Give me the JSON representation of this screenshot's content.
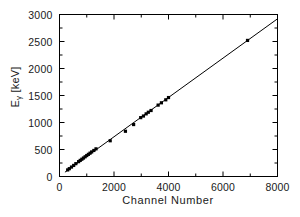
{
  "chart_data": {
    "type": "scatter",
    "title": "",
    "xlabel": "Channel Number",
    "ylabel_main": "E",
    "ylabel_sub": "γ",
    "ylabel_unit": " [keV]",
    "ylabel_full": "Eγ [keV]",
    "xlim": [
      0,
      8000
    ],
    "ylim": [
      0,
      3000
    ],
    "xticks": [
      0,
      2000,
      4000,
      6000,
      8000
    ],
    "yticks": [
      0,
      500,
      1000,
      1500,
      2000,
      2500,
      3000
    ],
    "xticklabels": [
      "0",
      "2000",
      "4000",
      "6000",
      "8000"
    ],
    "yticklabels": [
      "0",
      "500",
      "1000",
      "1500",
      "2000",
      "2500",
      "3000"
    ],
    "x_minor_step": 1000,
    "y_minor_step": 250,
    "grid": false,
    "legend": false,
    "marker": "square",
    "marker_color": "#000000",
    "marker_size": 3.2,
    "line_color": "#000000",
    "line_width": 1.0,
    "frame_color": "#000000",
    "background": "#ffffff",
    "fit_line": {
      "x": [
        200,
        8000
      ],
      "y": [
        80,
        2920
      ]
    },
    "series": [
      {
        "name": "calibration points",
        "points": [
          [
            300,
            122
          ],
          [
            360,
            145
          ],
          [
            440,
            175
          ],
          [
            520,
            205
          ],
          [
            600,
            238
          ],
          [
            700,
            275
          ],
          [
            760,
            298
          ],
          [
            820,
            320
          ],
          [
            880,
            342
          ],
          [
            940,
            365
          ],
          [
            1000,
            388
          ],
          [
            1060,
            410
          ],
          [
            1120,
            432
          ],
          [
            1180,
            455
          ],
          [
            1260,
            482
          ],
          [
            1340,
            512
          ],
          [
            1860,
            662
          ],
          [
            2420,
            838
          ],
          [
            2720,
            962
          ],
          [
            2980,
            1090
          ],
          [
            3080,
            1120
          ],
          [
            3180,
            1160
          ],
          [
            3260,
            1190
          ],
          [
            3360,
            1222
          ],
          [
            3620,
            1322
          ],
          [
            3740,
            1365
          ],
          [
            3900,
            1420
          ],
          [
            4000,
            1462
          ],
          [
            6900,
            2520
          ]
        ]
      }
    ]
  }
}
